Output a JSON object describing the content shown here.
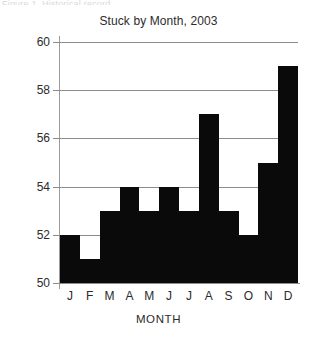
{
  "figure": {
    "caption_sliver": "Figure 1. Historical record",
    "background_color": "#ffffff"
  },
  "chart_data": {
    "type": "bar",
    "title": "Stuck by Month, 2003",
    "xlabel": "MONTH",
    "ylabel": "",
    "categories": [
      "J",
      "F",
      "M",
      "A",
      "M",
      "J",
      "J",
      "A",
      "S",
      "O",
      "N",
      "D"
    ],
    "values": [
      52,
      51,
      53,
      54,
      53,
      54,
      53,
      57,
      53,
      52,
      55,
      59
    ],
    "ylim": [
      50,
      60
    ],
    "yticks": [
      50,
      52,
      54,
      56,
      58,
      60
    ],
    "ytick_labels": [
      "50",
      "52",
      "54",
      "56",
      "58",
      "60"
    ],
    "grid": "horizontal",
    "legend": "none",
    "bar_color": "#0a0a0a",
    "gridline_color": "#8c8c8c",
    "axis_color": "#9a9a9a",
    "bar_gap": 0
  }
}
